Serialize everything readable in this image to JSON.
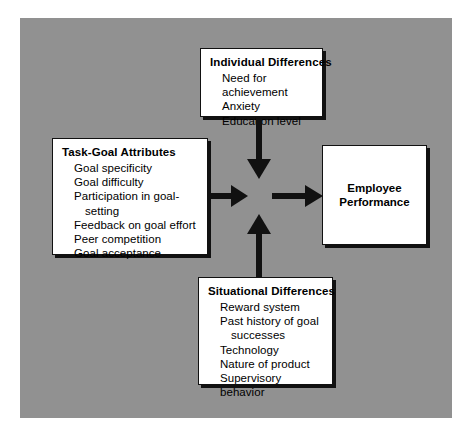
{
  "diagram": {
    "background_color": "#919191",
    "box_fill": "#ffffff",
    "line_color": "#111111",
    "boxes": {
      "individual": {
        "title": "Individual Differences",
        "items": [
          "Need for achievement",
          "Anxiety",
          "Education level"
        ]
      },
      "task_goal": {
        "title": "Task-Goal Attributes",
        "items": [
          "Goal specificity",
          "Goal difficulty",
          "Participation in goal-",
          "setting",
          "Feedback on goal effort",
          "Peer competition",
          "Goal acceptance"
        ]
      },
      "situational": {
        "title": "Situational Differences",
        "items": [
          "Reward system",
          "Past history of goal",
          "successes",
          "Technology",
          "Nature of product",
          "Supervisory behavior"
        ]
      },
      "employee": {
        "label": "Employee\nPerformance"
      }
    },
    "arrows": [
      {
        "name": "individual-to-center",
        "from": "Individual Differences",
        "to": "center",
        "direction": "down"
      },
      {
        "name": "task-goal-to-center",
        "from": "Task-Goal Attributes",
        "to": "center",
        "direction": "right"
      },
      {
        "name": "situational-to-center",
        "from": "Situational Differences",
        "to": "center",
        "direction": "up"
      },
      {
        "name": "center-to-employee",
        "from": "center",
        "to": "Employee Performance",
        "direction": "right"
      }
    ]
  }
}
